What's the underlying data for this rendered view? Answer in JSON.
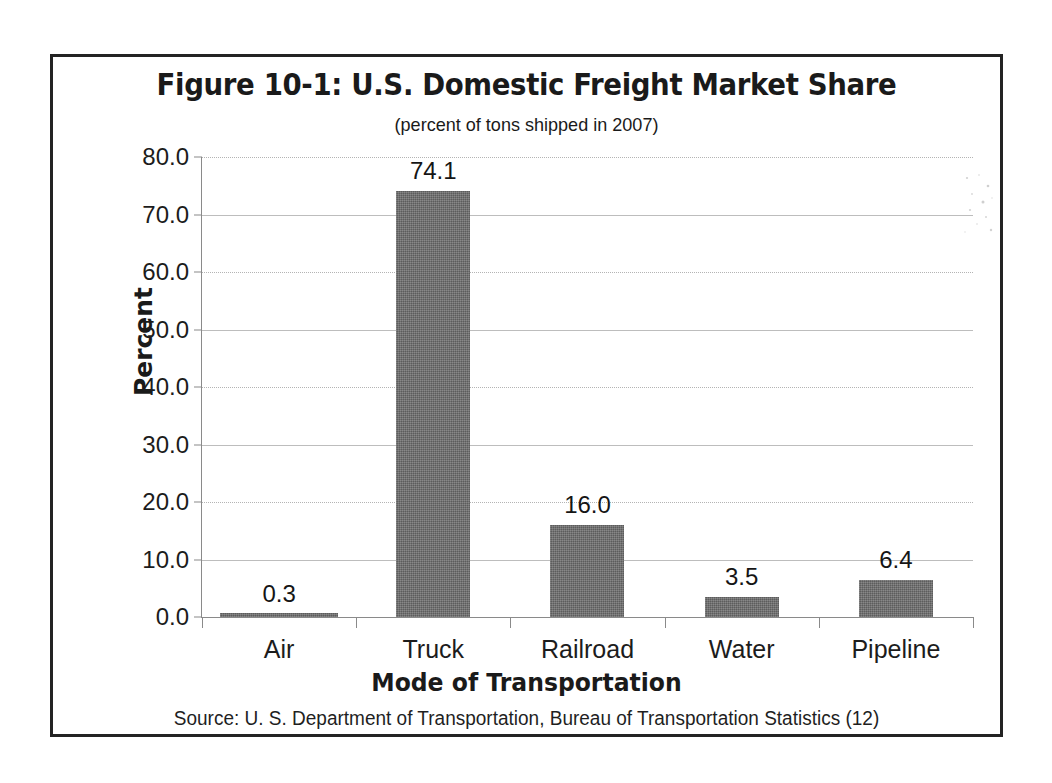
{
  "chart_data": {
    "type": "bar",
    "title": "Figure 10-1: U.S. Domestic Freight  Market Share",
    "subtitle": "(percent of tons shipped in 2007)",
    "categories": [
      "Air",
      "Truck",
      "Railroad",
      "Water",
      "Pipeline"
    ],
    "values": [
      0.3,
      74.1,
      16.0,
      3.5,
      6.4
    ],
    "value_labels": [
      "0.3",
      "74.1",
      "16.0",
      "3.5",
      "6.4"
    ],
    "xlabel": "Mode of  Transportation",
    "ylabel": "Percent",
    "ylim": [
      0,
      80
    ],
    "ytick_values": [
      80,
      70,
      60,
      50,
      40,
      30,
      20,
      10,
      0
    ],
    "ytick_labels": [
      "80.0",
      "70.0",
      "60.0",
      "50.0",
      "40.0",
      "30.0",
      "20.0",
      "10.0",
      "0.0"
    ],
    "grid": true,
    "legend": null,
    "bar_color": "#6b6b6b",
    "source": "Source: U. S. Department of Transportation, Bureau of Transportation Statistics (12)"
  }
}
